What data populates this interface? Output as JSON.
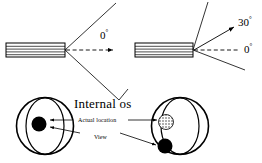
{
  "figure": {
    "type": "medical-illustration",
    "background_color": "#ffffff",
    "stroke_color": "#000000"
  },
  "panels": {
    "top_left": {
      "name": "zero-degree-panel",
      "angle_label": "0",
      "degree_symbol": "°",
      "probe_name": "transducer",
      "beam_type": "fan",
      "axis_type": "dashed-arrow"
    },
    "top_right": {
      "name": "thirty-degree-panel",
      "angle_label_primary": "30",
      "angle_label_secondary": "0",
      "degree_symbol": "°",
      "probe_name": "transducer",
      "beam_type": "fan",
      "axis_type": "dashed-arrow"
    },
    "bottom_left": {
      "name": "actual-location-view",
      "marker": "solid-dot"
    },
    "bottom_right": {
      "name": "observed-view",
      "markers": [
        "stippled-dot",
        "solid-dot"
      ]
    }
  },
  "labels": {
    "internal_os": "Internal os",
    "actual_location": "Actual location",
    "view": "View",
    "angle_zero_left": "0",
    "angle_zero_right": "0",
    "angle_thirty": "30",
    "degree": "°"
  }
}
